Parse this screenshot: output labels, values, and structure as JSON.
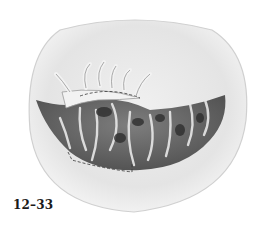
{
  "figure": {
    "label": "12–33"
  },
  "colors": {
    "background": "#ffffff",
    "outline": "#c8c8c8",
    "dark_tissue": "#4a4a4a",
    "mid_tissue": "#8a8a8a",
    "highlight": "#f4f4f4",
    "label": "#1a1a1a"
  }
}
